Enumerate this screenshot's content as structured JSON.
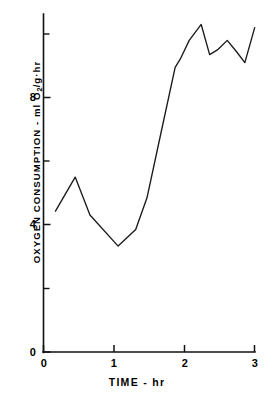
{
  "chart_data": {
    "type": "line",
    "title": "",
    "xlabel": "TIME - hr",
    "ylabel_text": "OXYGEN CONSUMPTION - ml O",
    "ylabel_sub": "2",
    "ylabel_tail": "/g·hr",
    "ylabel_full": "OXYGEN CONSUMPTION - ml O2/g·hr",
    "xlim": [
      0,
      3
    ],
    "ylim": [
      0,
      10.6
    ],
    "grid": false,
    "legend": null,
    "xticks": [
      0,
      1,
      2,
      3
    ],
    "xtick_labels": [
      "0",
      "1",
      "2",
      "3"
    ],
    "yticks": [
      0,
      4,
      8
    ],
    "ytick_labels": [
      "0",
      "4",
      "8"
    ],
    "y_minor_ticks": [
      2,
      6,
      10
    ],
    "series": [
      {
        "name": "Oxygen consumption",
        "x": [
          0.17,
          0.45,
          0.66,
          1.06,
          1.31,
          1.47,
          1.66,
          1.87,
          1.94,
          2.07,
          2.24,
          2.36,
          2.47,
          2.61,
          2.74,
          2.86,
          3.0
        ],
        "y": [
          4.43,
          5.5,
          4.31,
          3.33,
          3.85,
          4.85,
          6.8,
          8.95,
          9.2,
          9.8,
          10.3,
          9.35,
          9.5,
          9.8,
          9.45,
          9.1,
          10.2
        ]
      }
    ]
  }
}
